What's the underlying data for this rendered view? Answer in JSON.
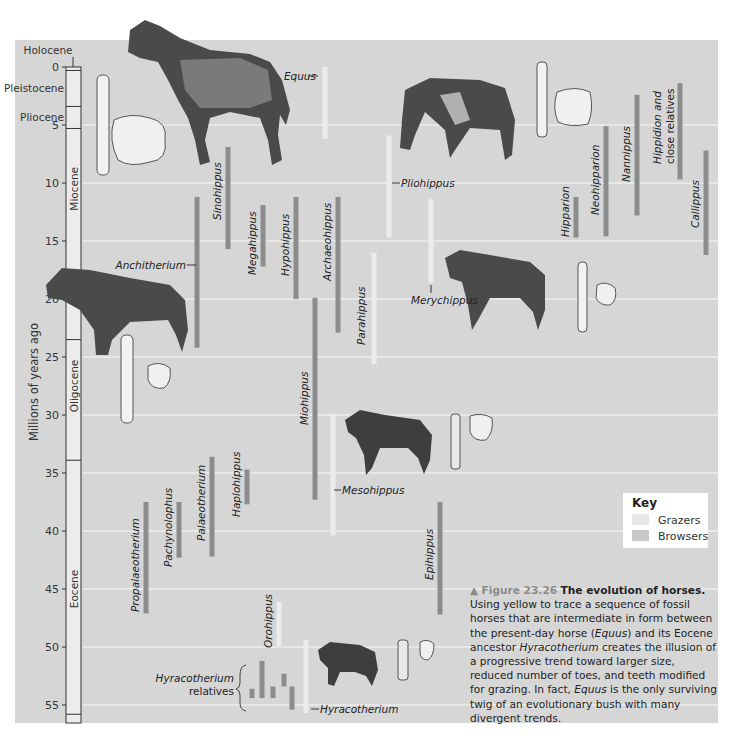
{
  "chart_data": {
    "type": "bar",
    "orientation": "vertical-ranges",
    "title": "Figure 23.26 The evolution of horses.",
    "ylabel": "Millions of years ago",
    "ylim": [
      0,
      56
    ],
    "yticks": [
      0,
      5,
      10,
      15,
      20,
      25,
      30,
      35,
      40,
      45,
      50,
      55
    ],
    "grid": true,
    "epochs": [
      {
        "name": "Holocene",
        "start": 0,
        "end": 0.3
      },
      {
        "name": "Pleistocene",
        "start": 0.3,
        "end": 3.4
      },
      {
        "name": "Pliocene",
        "start": 3.4,
        "end": 5.3
      },
      {
        "name": "Miocene",
        "start": 5.3,
        "end": 23.5
      },
      {
        "name": "Oligocene",
        "start": 23.5,
        "end": 33.9
      },
      {
        "name": "Eocene",
        "start": 33.9,
        "end": 55.8
      }
    ],
    "legend": {
      "title": "Key",
      "placement": "right",
      "entries": [
        {
          "name": "Grazers",
          "color": "#e8e8e8"
        },
        {
          "name": "Browsers",
          "color": "#c8c8c8"
        }
      ]
    },
    "series": [
      {
        "name": "Equus",
        "type": "grazer",
        "from": 0,
        "to": 6.2
      },
      {
        "name": "Sinohippus",
        "type": "browser",
        "from": 6.9,
        "to": 15.7
      },
      {
        "name": "Anchitherium",
        "type": "browser",
        "from": 11.2,
        "to": 24.2
      },
      {
        "name": "Megahippus",
        "type": "browser",
        "from": 11.9,
        "to": 17.2
      },
      {
        "name": "Hypohippus",
        "type": "browser",
        "from": 11.2,
        "to": 20
      },
      {
        "name": "Archaeohippus",
        "type": "browser",
        "from": 11.2,
        "to": 22.9
      },
      {
        "name": "Miohippus",
        "type": "browser",
        "from": 19.9,
        "to": 37.3
      },
      {
        "name": "Parahippus",
        "type": "grazer",
        "from": 16,
        "to": 25.6
      },
      {
        "name": "Pliohippus",
        "type": "grazer",
        "from": 5.9,
        "to": 14.7
      },
      {
        "name": "Merychippus",
        "type": "grazer",
        "from": 11.4,
        "to": 18.6
      },
      {
        "name": "Mesohippus",
        "type": "grazer",
        "from": 29.9,
        "to": 40.4
      },
      {
        "name": "Hipparion",
        "type": "browser",
        "from": 11.2,
        "to": 14.7
      },
      {
        "name": "Neohipparion",
        "type": "browser",
        "from": 5.1,
        "to": 14.6
      },
      {
        "name": "Nannippus",
        "type": "browser",
        "from": 2.4,
        "to": 12.8
      },
      {
        "name": "Hippidion and close relatives",
        "type": "browser",
        "from": 1.4,
        "to": 9.7
      },
      {
        "name": "Callippus",
        "type": "browser",
        "from": 7.2,
        "to": 16.2
      },
      {
        "name": "Propalaeotherium",
        "type": "browser",
        "from": 37.5,
        "to": 47.1
      },
      {
        "name": "Pachynolophus",
        "type": "browser",
        "from": 37.5,
        "to": 42.3
      },
      {
        "name": "Palaeotherium",
        "type": "browser",
        "from": 33.6,
        "to": 42.2
      },
      {
        "name": "Haplohippus",
        "type": "browser",
        "from": 34.7,
        "to": 37.7
      },
      {
        "name": "Epihippus",
        "type": "browser",
        "from": 37.5,
        "to": 47.2
      },
      {
        "name": "Orohippus",
        "type": "grazer",
        "from": 46.1,
        "to": 49.9
      },
      {
        "name": "Hyracotherium",
        "type": "grazer",
        "from": 49.4,
        "to": 55.7
      },
      {
        "name": "Hyracotherium relatives 1",
        "type": "browser",
        "from": 53.6,
        "to": 54.4
      },
      {
        "name": "Hyracotherium relatives 2",
        "type": "browser",
        "from": 51.2,
        "to": 54.4
      },
      {
        "name": "Hyracotherium relatives 3",
        "type": "browser",
        "from": 53.4,
        "to": 54.4
      },
      {
        "name": "Hyracotherium relatives 4",
        "type": "browser",
        "from": 52.3,
        "to": 53.4
      },
      {
        "name": "Hyracotherium relatives 5",
        "type": "browser",
        "from": 53.4,
        "to": 55.4
      }
    ]
  },
  "labels": {
    "equus": "Equus",
    "sinohippus": "Sinohippus",
    "anchitherium": "Anchitherium",
    "megahippus": "Megahippus",
    "hypohippus": "Hypohippus",
    "archaeohippus": "Archaeohippus",
    "miohippus": "Miohippus",
    "parahippus": "Parahippus",
    "pliohippus": "Pliohippus",
    "merychippus": "Merychippus",
    "mesohippus": "Mesohippus",
    "hipparion": "Hipparion",
    "neohipparion": "Neohipparion",
    "nannippus": "Nannippus",
    "hippidion_1": "Hippidion and",
    "hippidion_2": "close relatives",
    "callippus": "Callippus",
    "propalaeotherium": "Propalaeotherium",
    "pachynolophus": "Pachynolophus",
    "palaeotherium": "Palaeotherium",
    "haplohippus": "Haplohippus",
    "epihippus": "Epihippus",
    "orohippus": "Orohippus",
    "hyracotherium": "Hyracotherium",
    "hyracotherium_rel_1": "Hyracotherium",
    "hyracotherium_rel_2": "relatives"
  },
  "caption": {
    "arrow": "▲",
    "fig_num": "Figure 23.26",
    "fig_title": "The evolution of horses.",
    "t1": "Using yellow to trace a sequence of fossil horses that are intermediate in form between the present-day horse (",
    "t1_it": "Equus",
    "t2": ") and its Eocene ancestor ",
    "t2_it": "Hyracotherium",
    "t3": " creates the illusion of a progressive trend toward larger size, reduced number of toes, and teeth modified for grazing. In fact, ",
    "t3_it": "Equus",
    "t4": " is the only surviving twig of an evolutionary bush with many divergent trends."
  },
  "colors": {
    "panel": "#d6d6d6",
    "grazer": "#ececec",
    "browser": "#8c8c8c",
    "grid": "#ececec"
  }
}
